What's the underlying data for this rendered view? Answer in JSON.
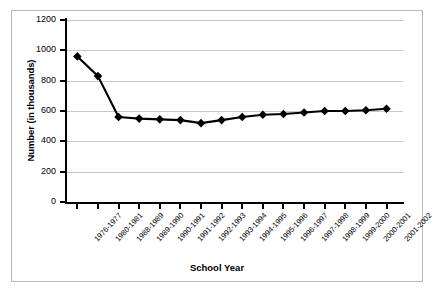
{
  "chart_data": {
    "type": "line",
    "title": "",
    "xlabel": "School Year",
    "ylabel": "Number (in thousands)",
    "ylim": [
      0,
      1200
    ],
    "yticks": [
      0,
      200,
      400,
      600,
      800,
      1000,
      1200
    ],
    "ytick_labels": [
      "0",
      "200",
      "400",
      "600",
      "800",
      "1000",
      "1200"
    ],
    "grid": true,
    "legend": "none",
    "marker": "diamond",
    "marker_color": "#000000",
    "line_color": "#000000",
    "categories": [
      "1976-1977",
      "1980-1981",
      "1988-1989",
      "1989-1990",
      "1990-1991",
      "1991-1992",
      "1992-1993",
      "1993-1994",
      "1994-1995",
      "1995-1996",
      "1996-1997",
      "1997-1998",
      "1998-1999",
      "1999-2000",
      "2000-2001",
      "2001-2002"
    ],
    "values": [
      960,
      830,
      560,
      550,
      545,
      540,
      520,
      540,
      560,
      575,
      580,
      590,
      600,
      600,
      605,
      615
    ]
  }
}
